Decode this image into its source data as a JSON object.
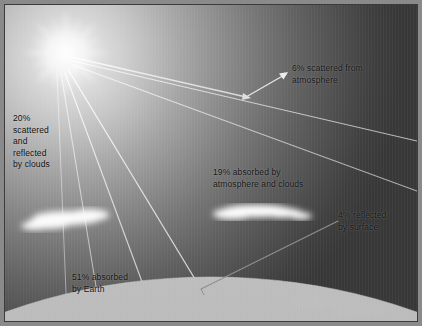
{
  "diagram": {
    "sun": {
      "name": "sun",
      "cx": 65,
      "cy": 52,
      "core_radius": 17,
      "ray_count": 16
    },
    "earth": {
      "name": "earth-surface",
      "label_color": "#111111",
      "fill": "#b4b4b4"
    },
    "labels": [
      {
        "id": "scattered-reflected-clouds",
        "text": "20%\nscattered\nand\nreflected\nby clouds",
        "percent": "20%",
        "x": 12,
        "y": 112
      },
      {
        "id": "scattered-from-atmosphere",
        "text": "6% scattered from\natmosphere",
        "percent": "6%",
        "x": 291,
        "y": 62
      },
      {
        "id": "absorbed-atmosphere-clouds",
        "text": "19% absorbed by\natmosphere and clouds",
        "percent": "19%",
        "x": 212,
        "y": 166
      },
      {
        "id": "reflected-by-surface",
        "text": "4% reflected\nby surface",
        "percent": "4%",
        "x": 337,
        "y": 209
      },
      {
        "id": "absorbed-by-earth",
        "text": "51% absorbed\nby Earth",
        "percent": "51%",
        "x": 71,
        "y": 271
      }
    ],
    "clouds": [
      {
        "id": "cloud-left",
        "x": 30,
        "y": 205,
        "w": 86,
        "h": 24
      },
      {
        "id": "cloud-right",
        "x": 214,
        "y": 199,
        "w": 88,
        "h": 22
      }
    ],
    "colors": {
      "sky_bright": "#f2f2f2",
      "sky_dark": "#383838",
      "earth": "#b4b4b4",
      "ray": "#e9e9e9",
      "dark_ray": "#6a6a6a",
      "frame": "#8a8a8a",
      "keyline": "#3b3b3b"
    }
  }
}
